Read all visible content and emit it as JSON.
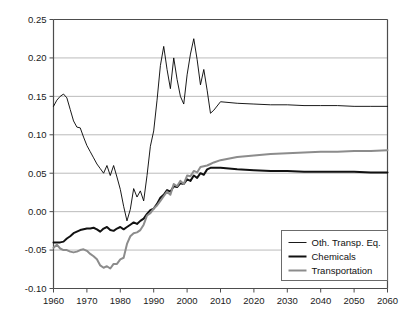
{
  "chart_data": {
    "type": "line",
    "title": "",
    "subtitle": "",
    "xlabel": "",
    "ylabel": "",
    "xlim": [
      1960,
      2060
    ],
    "ylim": [
      -0.1,
      0.25
    ],
    "grid": true,
    "grid_axis": "y",
    "legend_position": "bottom-right",
    "xticks": [
      1960,
      1970,
      1980,
      1990,
      2000,
      2010,
      2020,
      2030,
      2040,
      2050,
      2060
    ],
    "xtick_labels": [
      "1960",
      "1970",
      "1980",
      "1990",
      "2000",
      "2010",
      "2020",
      "2030",
      "2040",
      "2050",
      "2060"
    ],
    "yticks": [
      -0.1,
      -0.05,
      0.0,
      0.05,
      0.1,
      0.15,
      0.2,
      0.25
    ],
    "ytick_labels": [
      "-0.10",
      "-0.05",
      "0.00",
      "0.05",
      "0.10",
      "0.15",
      "0.20",
      "0.25"
    ],
    "series": [
      {
        "name": "Oth. Transp. Eq.",
        "color": "#000000",
        "width": 0.9,
        "x": [
          1960,
          1961,
          1962,
          1963,
          1964,
          1965,
          1966,
          1967,
          1968,
          1969,
          1970,
          1971,
          1972,
          1973,
          1974,
          1975,
          1976,
          1977,
          1978,
          1979,
          1980,
          1981,
          1982,
          1983,
          1984,
          1985,
          1986,
          1987,
          1988,
          1989,
          1990,
          1991,
          1992,
          1993,
          1994,
          1995,
          1996,
          1997,
          1998,
          1999,
          2000,
          2001,
          2002,
          2003,
          2004,
          2005,
          2006,
          2007,
          2008,
          2010,
          2015,
          2020,
          2025,
          2030,
          2035,
          2040,
          2045,
          2050,
          2055,
          2060
        ],
        "y": [
          0.137,
          0.145,
          0.15,
          0.153,
          0.148,
          0.133,
          0.118,
          0.11,
          0.109,
          0.097,
          0.086,
          0.078,
          0.07,
          0.062,
          0.056,
          0.05,
          0.06,
          0.047,
          0.06,
          0.045,
          0.029,
          0.007,
          -0.012,
          0.003,
          0.03,
          0.019,
          0.027,
          0.014,
          0.047,
          0.085,
          0.105,
          0.145,
          0.19,
          0.215,
          0.185,
          0.16,
          0.2,
          0.172,
          0.15,
          0.14,
          0.178,
          0.205,
          0.225,
          0.198,
          0.165,
          0.185,
          0.158,
          0.128,
          0.132,
          0.143,
          0.141,
          0.14,
          0.139,
          0.139,
          0.138,
          0.138,
          0.138,
          0.137,
          0.137,
          0.137
        ]
      },
      {
        "name": "Chemicals",
        "color": "#111111",
        "width": 2.0,
        "x": [
          1960,
          1961,
          1962,
          1963,
          1964,
          1965,
          1966,
          1967,
          1968,
          1969,
          1970,
          1971,
          1972,
          1973,
          1974,
          1975,
          1976,
          1977,
          1978,
          1979,
          1980,
          1981,
          1982,
          1983,
          1984,
          1985,
          1986,
          1987,
          1988,
          1989,
          1990,
          1991,
          1992,
          1993,
          1994,
          1995,
          1996,
          1997,
          1998,
          1999,
          2000,
          2001,
          2002,
          2003,
          2004,
          2005,
          2006,
          2007,
          2008,
          2010,
          2015,
          2020,
          2025,
          2030,
          2035,
          2040,
          2045,
          2050,
          2055,
          2060
        ],
        "y": [
          -0.04,
          -0.04,
          -0.04,
          -0.039,
          -0.035,
          -0.032,
          -0.028,
          -0.026,
          -0.024,
          -0.023,
          -0.022,
          -0.022,
          -0.021,
          -0.023,
          -0.026,
          -0.022,
          -0.02,
          -0.024,
          -0.025,
          -0.022,
          -0.02,
          -0.023,
          -0.02,
          -0.017,
          -0.014,
          -0.016,
          -0.012,
          -0.009,
          -0.003,
          0.002,
          0.004,
          0.01,
          0.018,
          0.022,
          0.028,
          0.026,
          0.033,
          0.032,
          0.037,
          0.036,
          0.042,
          0.04,
          0.047,
          0.044,
          0.05,
          0.048,
          0.055,
          0.057,
          0.057,
          0.057,
          0.055,
          0.054,
          0.053,
          0.053,
          0.052,
          0.052,
          0.052,
          0.052,
          0.051,
          0.051
        ]
      },
      {
        "name": "Transportation",
        "color": "#8c8c8c",
        "width": 2.0,
        "x": [
          1960,
          1961,
          1962,
          1963,
          1964,
          1965,
          1966,
          1967,
          1968,
          1969,
          1970,
          1971,
          1972,
          1973,
          1974,
          1975,
          1976,
          1977,
          1978,
          1979,
          1980,
          1981,
          1982,
          1983,
          1984,
          1985,
          1986,
          1987,
          1988,
          1989,
          1990,
          1991,
          1992,
          1993,
          1994,
          1995,
          1996,
          1997,
          1998,
          1999,
          2000,
          2001,
          2002,
          2003,
          2004,
          2005,
          2006,
          2007,
          2008,
          2010,
          2015,
          2020,
          2025,
          2030,
          2035,
          2040,
          2045,
          2050,
          2055,
          2060
        ],
        "y": [
          -0.047,
          -0.043,
          -0.048,
          -0.05,
          -0.05,
          -0.052,
          -0.053,
          -0.052,
          -0.05,
          -0.049,
          -0.051,
          -0.055,
          -0.058,
          -0.062,
          -0.07,
          -0.073,
          -0.071,
          -0.074,
          -0.068,
          -0.068,
          -0.062,
          -0.06,
          -0.042,
          -0.032,
          -0.028,
          -0.027,
          -0.024,
          -0.017,
          -0.005,
          -0.002,
          0.004,
          0.008,
          0.014,
          0.02,
          0.026,
          0.022,
          0.036,
          0.033,
          0.04,
          0.036,
          0.047,
          0.046,
          0.053,
          0.051,
          0.058,
          0.059,
          0.06,
          0.062,
          0.064,
          0.067,
          0.071,
          0.073,
          0.075,
          0.076,
          0.077,
          0.078,
          0.078,
          0.079,
          0.079,
          0.08
        ]
      }
    ]
  },
  "legend": {
    "entries": [
      {
        "label": "Oth. Transp. Eq."
      },
      {
        "label": "Chemicals"
      },
      {
        "label": "Transportation"
      }
    ]
  },
  "colors": {
    "axis": "#4d4d4d",
    "grid": "#b3b3b3",
    "series_thin": "#000000",
    "series_thick": "#111111",
    "series_gray": "#8c8c8c",
    "background": "#ffffff"
  }
}
